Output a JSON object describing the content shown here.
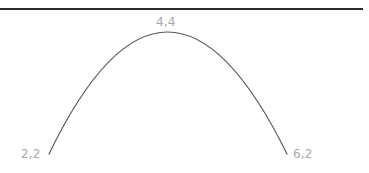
{
  "diagram": {
    "rule_color": "#2a2a2a",
    "curve_color": "#555555",
    "label_color": "#a8a8a8",
    "points": [
      {
        "label": "2,2",
        "x": 2,
        "y": 2
      },
      {
        "label": "4,4",
        "x": 4,
        "y": 4
      },
      {
        "label": "6,2",
        "x": 6,
        "y": 2
      }
    ]
  }
}
